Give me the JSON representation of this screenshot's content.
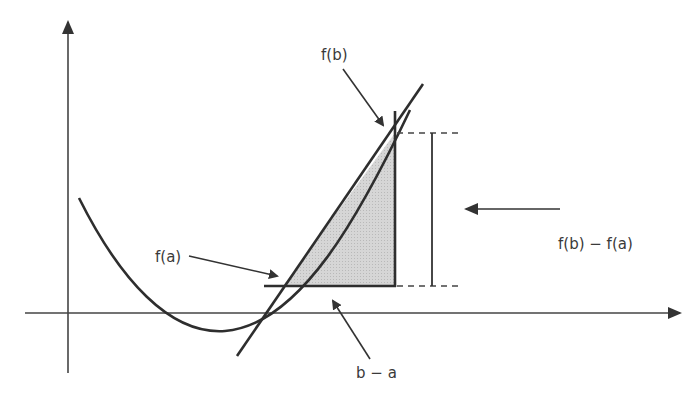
{
  "diagram": {
    "type": "mean-value-theorem-illustration",
    "labels": {
      "f_b": "f(b)",
      "f_a": "f(a)",
      "difference_y": "f(b) − f(a)",
      "difference_x": "b − a"
    },
    "colors": {
      "line": "#2e2e2e",
      "axis": "#444444",
      "fill": "#d3d3d3",
      "text": "#3a3a3a",
      "background": "#ffffff"
    }
  }
}
